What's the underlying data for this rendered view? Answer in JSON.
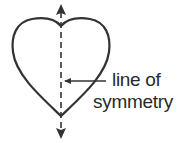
{
  "diagram": {
    "shape": "heart",
    "label_line1": "line of",
    "label_line2": "symmetry",
    "label_full": "line of symmetry",
    "colors": {
      "stroke": "#333333",
      "background": "#ffffff"
    }
  }
}
